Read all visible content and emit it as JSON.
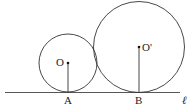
{
  "diagram": {
    "type": "geometry",
    "line_label": "ℓ",
    "circles": [
      {
        "center_label": "O",
        "tangent_point_label": "A",
        "cx": 68,
        "cy": 63,
        "r": 29
      },
      {
        "center_label": "O'",
        "tangent_point_label": "B",
        "cx": 139,
        "cy": 47,
        "r": 45
      }
    ],
    "colors": {
      "stroke": "#333333",
      "background": "#ffffff"
    }
  }
}
